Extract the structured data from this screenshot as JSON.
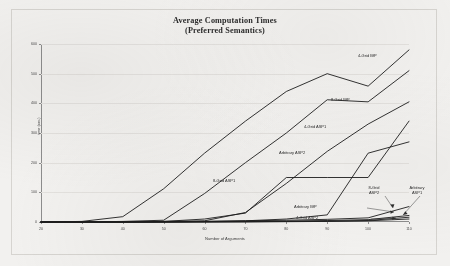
{
  "chart_data": {
    "type": "line",
    "title": "Average Computation Times",
    "subtitle": "(Preferred Semantics)",
    "xlabel": "Number of Arguments",
    "ylabel": "time (sec.)",
    "xlim": [
      20,
      110
    ],
    "ylim": [
      0,
      600
    ],
    "xticks": [
      "20",
      "30",
      "40",
      "50",
      "60",
      "70",
      "80",
      "90",
      "100",
      "110"
    ],
    "yticks": [
      "600",
      "500",
      "400",
      "300",
      "200",
      "100",
      "0"
    ],
    "grid": true,
    "legend_position": "inline-annotations",
    "x": [
      20,
      30,
      40,
      50,
      60,
      70,
      80,
      90,
      100,
      110
    ],
    "series": [
      {
        "name": "4-Grid BfP",
        "values": [
          0,
          2,
          18,
          112,
          232,
          340,
          440,
          500,
          458,
          580
        ]
      },
      {
        "name": "8-Grid BfP",
        "values": [
          0,
          0,
          2,
          6,
          96,
          200,
          300,
          412,
          405,
          510
        ]
      },
      {
        "name": "4-Grid ASP1",
        "values": [
          0,
          0,
          0,
          2,
          4,
          32,
          130,
          238,
          330,
          405
        ]
      },
      {
        "name": "Arbitrary ASP2",
        "values": [
          0,
          0,
          0,
          0,
          2,
          4,
          10,
          24,
          232,
          270
        ]
      },
      {
        "name": "8-Grid ASP1",
        "values": [
          0,
          0,
          0,
          2,
          10,
          30,
          150,
          150,
          150,
          340
        ]
      },
      {
        "name": "Arbitrary BfP",
        "values": [
          0,
          0,
          0,
          1,
          2,
          4,
          6,
          9,
          14,
          52
        ]
      },
      {
        "name": "8-Grid ASP2",
        "values": [
          0,
          0,
          0,
          0,
          1,
          2,
          3,
          5,
          8,
          22
        ]
      },
      {
        "name": "4-Grid ASP2",
        "values": [
          0,
          0,
          0,
          0,
          0,
          1,
          2,
          3,
          5,
          16
        ]
      },
      {
        "name": "Arbitrary ASP1",
        "values": [
          0,
          0,
          0,
          0,
          0,
          0,
          1,
          2,
          4,
          10
        ]
      }
    ],
    "annotations": [
      {
        "label": "4-Grid BfP"
      },
      {
        "label": "8-Grid BfP"
      },
      {
        "label": "4-Grid ASP1"
      },
      {
        "label": "Arbitrary ASP2"
      },
      {
        "label": "8-Grid ASP1"
      },
      {
        "label": "Arbitrary BfP"
      },
      {
        "label": "4-Grid ASP2"
      },
      {
        "label": "8-Grid ASP2"
      },
      {
        "label": "Arbitrary ASP1"
      }
    ],
    "colors": {
      "line": "#1d1d1d",
      "axis": "#8d8d8d",
      "grid": "#e3e1de",
      "background": "#f2f1ef"
    }
  },
  "annotation_text": {
    "grid4_bfp": "4-Grid BfP",
    "grid8_bfp": "8-Grid BfP",
    "grid4_asp1": "4-Grid ASP1",
    "arb_asp2": "Arbitrary ASP2",
    "grid8_asp1": "8-Grid ASP1",
    "arb_bfp": "Arbitrary BfP",
    "grid4_asp2": "4-Grid ASP2",
    "grid8_asp2_l1": "8-Grid",
    "grid8_asp2_l2": "ASP2",
    "arb_asp1_l1": "Arbitrary",
    "arb_asp1_l2": "ASP1"
  }
}
